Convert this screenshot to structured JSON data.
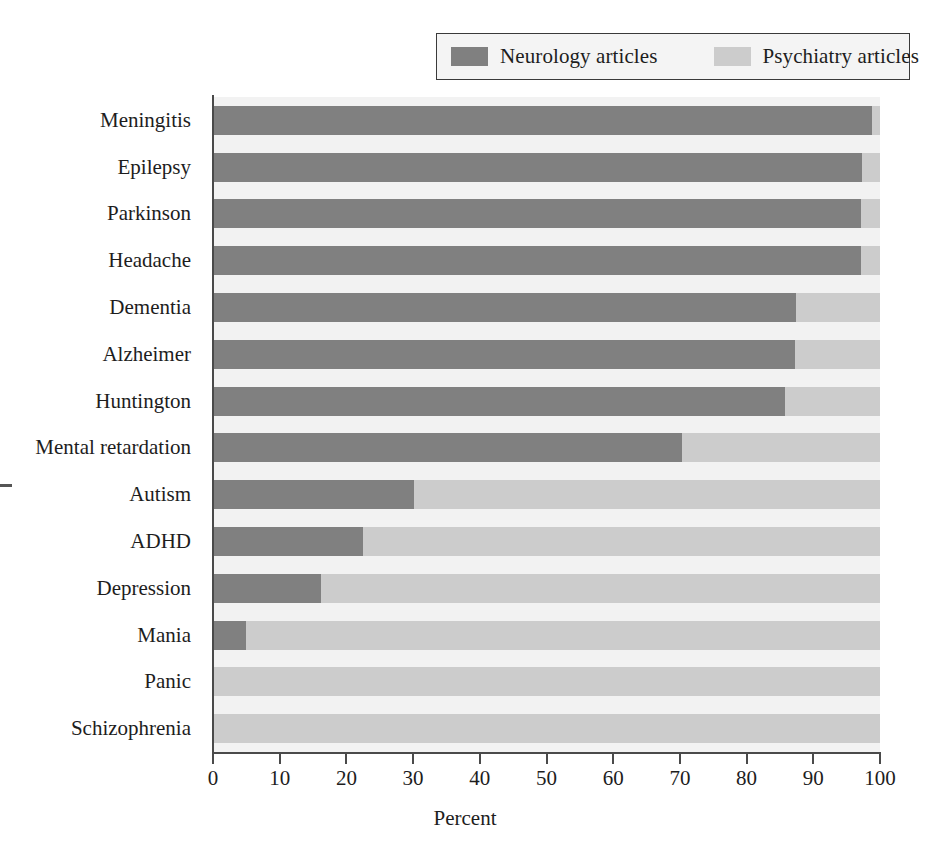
{
  "legend": {
    "entries": [
      {
        "label": "Neurology articles",
        "color": "#808080",
        "key": "neurology"
      },
      {
        "label": "Psychiatry articles",
        "color": "#cccccc",
        "key": "psychiatry"
      }
    ]
  },
  "axis": {
    "x_title": "Percent",
    "x_ticks": [
      0,
      10,
      20,
      30,
      40,
      50,
      60,
      70,
      80,
      90,
      100
    ]
  },
  "colors": {
    "neurology": "#808080",
    "psychiatry": "#cccccc",
    "plot_background": "#f2f2f2",
    "axis": "#4a4a4a",
    "text": "#1d1d1d",
    "legend_border": "#3a3a3a",
    "legend_background": "#f4f4f4"
  },
  "chart_data": {
    "type": "bar",
    "orientation": "horizontal",
    "stacked": true,
    "normalized": true,
    "title": "",
    "xlabel": "Percent",
    "ylabel": "",
    "xlim": [
      0,
      100
    ],
    "xticks": [
      0,
      10,
      20,
      30,
      40,
      50,
      60,
      70,
      80,
      90,
      100
    ],
    "grid": false,
    "legend_position": "top-right",
    "categories": [
      "Meningitis",
      "Epilepsy",
      "Parkinson",
      "Headache",
      "Dementia",
      "Alzheimer",
      "Huntington",
      "Mental retardation",
      "Autism",
      "ADHD",
      "Depression",
      "Mania",
      "Panic",
      "Schizophrenia"
    ],
    "series": [
      {
        "name": "Neurology articles",
        "color": "#808080",
        "values": [
          98.8,
          97.3,
          97.2,
          97.2,
          87.4,
          87.2,
          85.8,
          70.3,
          30.1,
          22.5,
          16.2,
          5.0,
          0.0,
          0.0
        ]
      },
      {
        "name": "Psychiatry articles",
        "color": "#cccccc",
        "values": [
          1.2,
          2.7,
          2.8,
          2.8,
          12.6,
          12.8,
          14.2,
          29.7,
          69.9,
          77.5,
          83.8,
          95.0,
          100.0,
          100.0
        ]
      }
    ]
  }
}
